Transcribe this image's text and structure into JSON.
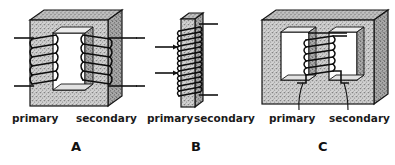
{
  "figure": {
    "caption_letters": [
      "A",
      "B",
      "C"
    ],
    "background_color": "#ffffff",
    "ink_color": "#121212",
    "core_fill_color": "#c9c9c9",
    "core_shadow_color": "#8f8f8f",
    "panels": [
      {
        "letter": "A",
        "description": "rectangular closed core transformer with windings on both vertical legs",
        "labels": [
          {
            "text": "primary",
            "side": "left"
          },
          {
            "text": "secondary",
            "side": "right"
          }
        ],
        "lead_count": 4,
        "coil_turns_primary": 6,
        "coil_turns_secondary": 6
      },
      {
        "letter": "B",
        "description": "straight bar core transformer with both windings stacked on one limb",
        "labels": [
          {
            "text": "primary",
            "side": "left"
          },
          {
            "text": "secondary",
            "side": "right"
          }
        ],
        "lead_count": 4,
        "coil_turns_primary": 7,
        "coil_turns_secondary": 7
      },
      {
        "letter": "C",
        "description": "shell type core transformer with both windings on the centre limb",
        "labels": [
          {
            "text": "primary",
            "side": "left"
          },
          {
            "text": "secondary",
            "side": "right"
          }
        ],
        "lead_count": 2,
        "coil_turns_primary": 4,
        "coil_turns_secondary": 4
      }
    ]
  }
}
